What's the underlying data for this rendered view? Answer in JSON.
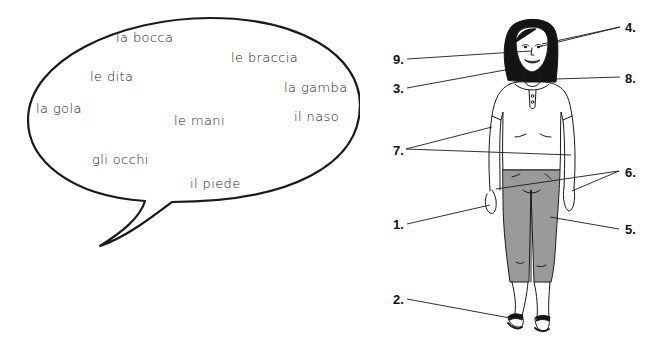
{
  "speech_bubble": {
    "words": [
      {
        "text": "la bocca",
        "x": 116,
        "y": 30
      },
      {
        "text": "le braccia",
        "x": 231,
        "y": 50
      },
      {
        "text": "le dita",
        "x": 90,
        "y": 69
      },
      {
        "text": "la gamba",
        "x": 284,
        "y": 80
      },
      {
        "text": "la gola",
        "x": 36,
        "y": 101
      },
      {
        "text": "il naso",
        "x": 294,
        "y": 109
      },
      {
        "text": "le mani",
        "x": 174,
        "y": 113
      },
      {
        "text": "gli occhi",
        "x": 92,
        "y": 152
      },
      {
        "text": "il piede",
        "x": 190,
        "y": 176
      }
    ]
  },
  "figure": {
    "labels": [
      {
        "id": "4",
        "text": "4.",
        "x": 625,
        "y": 20
      },
      {
        "id": "9",
        "text": "9.",
        "x": 393,
        "y": 52
      },
      {
        "id": "8",
        "text": "8.",
        "x": 625,
        "y": 71
      },
      {
        "id": "3",
        "text": "3.",
        "x": 393,
        "y": 81
      },
      {
        "id": "7",
        "text": "7.",
        "x": 393,
        "y": 143
      },
      {
        "id": "6",
        "text": "6.",
        "x": 625,
        "y": 165
      },
      {
        "id": "1",
        "text": "1.",
        "x": 393,
        "y": 217
      },
      {
        "id": "5",
        "text": "5.",
        "x": 625,
        "y": 222
      },
      {
        "id": "2",
        "text": "2.",
        "x": 393,
        "y": 292
      }
    ]
  },
  "colors": {
    "outline": "#1a1a1a",
    "pants": "#9a9a9a",
    "hair": "#141414",
    "background": "#ffffff"
  }
}
